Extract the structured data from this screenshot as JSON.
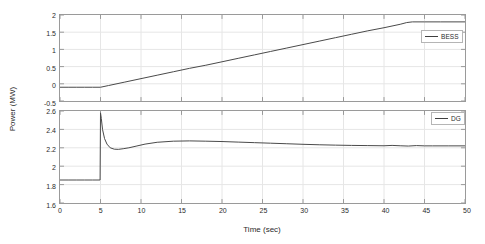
{
  "figure": {
    "background_color": "#ffffff",
    "axis_color": "#9a9a9a",
    "grid_color": "#e6e6e6",
    "line_color": "#4a4a4a",
    "xlabel": "Time (sec)",
    "ylabel": "Power (MW)"
  },
  "chart_data": [
    {
      "type": "line",
      "id": "bess-subplot",
      "title": "",
      "xlabel": "",
      "ylabel": "Power (MW)",
      "xlim": [
        0,
        50
      ],
      "ylim": [
        -0.5,
        2
      ],
      "xticks": [
        0,
        5,
        10,
        15,
        20,
        25,
        30,
        35,
        40,
        45,
        50
      ],
      "yticks": [
        -0.5,
        0,
        0.5,
        1,
        1.5,
        2
      ],
      "ytick_labels": [
        "-0.5",
        "0",
        "0.5",
        "1",
        "1.5",
        "2"
      ],
      "grid": true,
      "legend": [
        "BESS"
      ],
      "legend_position": "right",
      "series": [
        {
          "name": "BESS",
          "color": "#4a4a4a",
          "x": [
            0,
            1,
            2,
            3,
            4,
            5,
            6,
            8,
            10,
            12,
            14,
            16,
            18,
            20,
            22,
            24,
            26,
            28,
            30,
            32,
            34,
            36,
            38,
            40,
            42,
            42.8,
            43.5,
            45,
            47,
            50
          ],
          "values": [
            -0.1,
            -0.1,
            -0.1,
            -0.1,
            -0.1,
            -0.1,
            -0.05,
            0.05,
            0.15,
            0.25,
            0.35,
            0.45,
            0.54,
            0.64,
            0.74,
            0.84,
            0.94,
            1.04,
            1.14,
            1.24,
            1.34,
            1.44,
            1.54,
            1.63,
            1.73,
            1.78,
            1.8,
            1.8,
            1.8,
            1.8
          ]
        }
      ]
    },
    {
      "type": "line",
      "id": "dg-subplot",
      "title": "",
      "xlabel": "Time (sec)",
      "ylabel": "Power (MW)",
      "xlim": [
        0,
        50
      ],
      "ylim": [
        1.6,
        2.6
      ],
      "xticks": [
        0,
        5,
        10,
        15,
        20,
        25,
        30,
        35,
        40,
        45,
        50
      ],
      "yticks": [
        1.6,
        1.8,
        2,
        2.2,
        2.4,
        2.6
      ],
      "ytick_labels": [
        "1.6",
        "1.8",
        "2",
        "2.2",
        "2.4",
        "2.6"
      ],
      "grid": true,
      "legend": [
        "DG"
      ],
      "legend_position": "right",
      "series": [
        {
          "name": "DG",
          "color": "#4a4a4a",
          "x": [
            0,
            1,
            2,
            3,
            4,
            4.95,
            5.0,
            5.1,
            5.25,
            5.5,
            5.8,
            6.2,
            6.7,
            7.2,
            7.8,
            8.5,
            9.5,
            10.5,
            12,
            14,
            16,
            18,
            20,
            22,
            24,
            26,
            28,
            30,
            32,
            34,
            36,
            38,
            40,
            41,
            42,
            43,
            44,
            45,
            46,
            48,
            50
          ],
          "values": [
            1.85,
            1.85,
            1.85,
            1.85,
            1.85,
            1.85,
            2.58,
            2.52,
            2.4,
            2.3,
            2.24,
            2.2,
            2.185,
            2.183,
            2.19,
            2.2,
            2.22,
            2.24,
            2.26,
            2.272,
            2.275,
            2.272,
            2.268,
            2.262,
            2.256,
            2.25,
            2.244,
            2.238,
            2.233,
            2.229,
            2.226,
            2.224,
            2.222,
            2.226,
            2.222,
            2.219,
            2.224,
            2.221,
            2.221,
            2.221,
            2.221
          ]
        }
      ]
    }
  ]
}
